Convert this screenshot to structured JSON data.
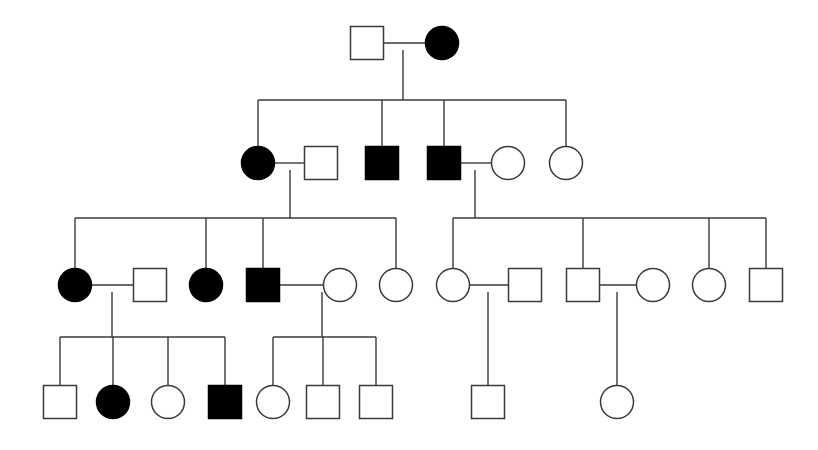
{
  "figure": {
    "kind": "pedigree-chart",
    "title": "",
    "background_color": "#ffffff",
    "line_color": "#3a3a3a",
    "affected_fill": "#000000",
    "unaffected_fill": "#ffffff",
    "canvas_width": 818,
    "canvas_height": 450
  },
  "legend": {
    "square_meaning": "male",
    "circle_meaning": "female",
    "filled_meaning": "affected",
    "open_meaning": "unaffected"
  },
  "chart_data": {
    "type": "diagram",
    "title": "",
    "generations": [
      {
        "id": "I",
        "y": 43,
        "individuals": [
          {
            "id": "I-1",
            "sex": "male",
            "shape": "square",
            "affected": false,
            "x": 367,
            "y": 43,
            "size": 33
          },
          {
            "id": "I-2",
            "sex": "female",
            "shape": "circle",
            "affected": true,
            "x": 442,
            "y": 43,
            "size": 33
          }
        ]
      },
      {
        "id": "II",
        "y": 163,
        "individuals": [
          {
            "id": "II-1",
            "sex": "female",
            "shape": "circle",
            "affected": true,
            "x": 258,
            "y": 163,
            "size": 33
          },
          {
            "id": "II-2",
            "sex": "male",
            "shape": "square",
            "affected": false,
            "x": 321,
            "y": 163,
            "size": 33
          },
          {
            "id": "II-3",
            "sex": "male",
            "shape": "square",
            "affected": true,
            "x": 382,
            "y": 163,
            "size": 33
          },
          {
            "id": "II-4",
            "sex": "male",
            "shape": "square",
            "affected": true,
            "x": 444,
            "y": 163,
            "size": 33
          },
          {
            "id": "II-5",
            "sex": "female",
            "shape": "circle",
            "affected": false,
            "x": 508,
            "y": 163,
            "size": 33
          },
          {
            "id": "II-6",
            "sex": "female",
            "shape": "circle",
            "affected": false,
            "x": 566,
            "y": 163,
            "size": 33
          }
        ]
      },
      {
        "id": "III",
        "y": 285,
        "individuals": [
          {
            "id": "III-1",
            "sex": "female",
            "shape": "circle",
            "affected": true,
            "x": 75,
            "y": 285,
            "size": 33
          },
          {
            "id": "III-2",
            "sex": "male",
            "shape": "square",
            "affected": false,
            "x": 150,
            "y": 285,
            "size": 33
          },
          {
            "id": "III-3",
            "sex": "female",
            "shape": "circle",
            "affected": true,
            "x": 206,
            "y": 285,
            "size": 33
          },
          {
            "id": "III-4",
            "sex": "male",
            "shape": "square",
            "affected": true,
            "x": 263,
            "y": 285,
            "size": 33
          },
          {
            "id": "III-5",
            "sex": "female",
            "shape": "circle",
            "affected": false,
            "x": 340,
            "y": 285,
            "size": 33
          },
          {
            "id": "III-6",
            "sex": "female",
            "shape": "circle",
            "affected": false,
            "x": 396,
            "y": 285,
            "size": 33
          },
          {
            "id": "III-7",
            "sex": "female",
            "shape": "circle",
            "affected": false,
            "x": 453,
            "y": 285,
            "size": 33
          },
          {
            "id": "III-8",
            "sex": "male",
            "shape": "square",
            "affected": false,
            "x": 525,
            "y": 285,
            "size": 33
          },
          {
            "id": "III-9",
            "sex": "male",
            "shape": "square",
            "affected": false,
            "x": 583,
            "y": 285,
            "size": 33
          },
          {
            "id": "III-10",
            "sex": "female",
            "shape": "circle",
            "affected": false,
            "x": 653,
            "y": 285,
            "size": 33
          },
          {
            "id": "III-11",
            "sex": "female",
            "shape": "circle",
            "affected": false,
            "x": 709,
            "y": 285,
            "size": 33
          },
          {
            "id": "III-12",
            "sex": "male",
            "shape": "square",
            "affected": false,
            "x": 766,
            "y": 285,
            "size": 33
          }
        ]
      },
      {
        "id": "IV",
        "y": 402,
        "individuals": [
          {
            "id": "IV-1",
            "sex": "male",
            "shape": "square",
            "affected": false,
            "x": 60,
            "y": 402,
            "size": 33
          },
          {
            "id": "IV-2",
            "sex": "female",
            "shape": "circle",
            "affected": true,
            "x": 113,
            "y": 402,
            "size": 33
          },
          {
            "id": "IV-3",
            "sex": "female",
            "shape": "circle",
            "affected": false,
            "x": 168,
            "y": 402,
            "size": 33
          },
          {
            "id": "IV-4",
            "sex": "male",
            "shape": "square",
            "affected": true,
            "x": 225,
            "y": 402,
            "size": 33
          },
          {
            "id": "IV-5",
            "sex": "female",
            "shape": "circle",
            "affected": false,
            "x": 273,
            "y": 402,
            "size": 33
          },
          {
            "id": "IV-6",
            "sex": "male",
            "shape": "square",
            "affected": false,
            "x": 323,
            "y": 402,
            "size": 33
          },
          {
            "id": "IV-7",
            "sex": "male",
            "shape": "square",
            "affected": false,
            "x": 376,
            "y": 402,
            "size": 33
          },
          {
            "id": "IV-8",
            "sex": "male",
            "shape": "square",
            "affected": false,
            "x": 488,
            "y": 402,
            "size": 33
          },
          {
            "id": "IV-9",
            "sex": "female",
            "shape": "circle",
            "affected": false,
            "x": 617,
            "y": 402,
            "size": 33
          }
        ]
      }
    ],
    "matings": [
      {
        "id": "mating-I-1",
        "partner_a": "I-1",
        "partner_b": "I-2",
        "line_y": 43,
        "x_start": 384,
        "x_end": 425,
        "descent_x": 403
      },
      {
        "id": "mating-II-1",
        "partner_a": "II-1",
        "partner_b": "II-2",
        "line_y": 163,
        "x_start": 275,
        "x_end": 305,
        "descent_x": 290
      },
      {
        "id": "mating-II-4",
        "partner_a": "II-4",
        "partner_b": "II-5",
        "line_y": 163,
        "x_start": 461,
        "x_end": 492,
        "descent_x": 475
      },
      {
        "id": "mating-III-1",
        "partner_a": "III-1",
        "partner_b": "III-2",
        "line_y": 285,
        "x_start": 92,
        "x_end": 134,
        "descent_x": 112
      },
      {
        "id": "mating-III-4",
        "partner_a": "III-4",
        "partner_b": "III-5",
        "line_y": 285,
        "x_start": 280,
        "x_end": 324,
        "descent_x": 322
      },
      {
        "id": "mating-III-7",
        "partner_a": "III-7",
        "partner_b": "III-8",
        "line_y": 285,
        "x_start": 470,
        "x_end": 509,
        "descent_x": 488
      },
      {
        "id": "mating-III-9",
        "partner_a": "III-9",
        "partner_b": "III-10",
        "line_y": 285,
        "x_start": 600,
        "x_end": 637,
        "descent_x": 617
      }
    ],
    "sibships": [
      {
        "id": "sibship-gen-II",
        "parent_descent_x": 403,
        "parent_descent_y_start": 50,
        "bar_y": 100,
        "bar_x_start": 258,
        "bar_x_end": 566,
        "child_drop_xs": [
          258,
          382,
          444,
          566
        ],
        "child_top_y": 146
      },
      {
        "id": "sibship-gen-III-left",
        "parent_descent_x": 290,
        "parent_descent_y_start": 170,
        "bar_y": 218,
        "bar_x_start": 75,
        "bar_x_end": 396,
        "child_drop_xs": [
          75,
          206,
          263,
          396
        ],
        "child_top_y": 268
      },
      {
        "id": "sibship-gen-III-right",
        "parent_descent_x": 475,
        "parent_descent_y_start": 170,
        "bar_y": 218,
        "bar_x_start": 453,
        "bar_x_end": 766,
        "child_drop_xs": [
          453,
          583,
          709,
          766
        ],
        "child_top_y": 268
      },
      {
        "id": "sibship-gen-IV-left",
        "parent_descent_x": 112,
        "parent_descent_y_start": 292,
        "bar_y": 337,
        "bar_x_start": 60,
        "bar_x_end": 225,
        "child_drop_xs": [
          60,
          113,
          168,
          225
        ],
        "child_top_y": 385
      },
      {
        "id": "sibship-gen-IV-middle",
        "parent_descent_x": 322,
        "parent_descent_y_start": 292,
        "bar_y": 337,
        "bar_x_start": 273,
        "bar_x_end": 376,
        "child_drop_xs": [
          273,
          323,
          376
        ],
        "child_top_y": 385
      }
    ],
    "single_child_lines": [
      {
        "id": "only-child-IV-8",
        "x": 488,
        "y_start": 292,
        "y_end": 385
      },
      {
        "id": "only-child-IV-9",
        "x": 617,
        "y_start": 292,
        "y_end": 385
      }
    ],
    "counts": {
      "total_individuals": 29,
      "affected_individuals": 9,
      "unaffected_individuals": 20,
      "generations": 4,
      "affected_males": 4,
      "affected_females": 5
    }
  }
}
